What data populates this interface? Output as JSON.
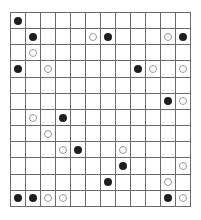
{
  "puzzle": {
    "rows": 12,
    "cols": 12,
    "colors": {
      "grid_line": "#6a6a6a",
      "black_stone": "#1e1e1e",
      "white_stone_border": "#9a9a9a",
      "background": "#ffffff"
    },
    "stones": [
      {
        "row": 0,
        "col": 0,
        "color": "black"
      },
      {
        "row": 1,
        "col": 1,
        "color": "black"
      },
      {
        "row": 1,
        "col": 5,
        "color": "white"
      },
      {
        "row": 1,
        "col": 6,
        "color": "black"
      },
      {
        "row": 1,
        "col": 10,
        "color": "white"
      },
      {
        "row": 1,
        "col": 11,
        "color": "black"
      },
      {
        "row": 2,
        "col": 1,
        "color": "white"
      },
      {
        "row": 3,
        "col": 0,
        "color": "black"
      },
      {
        "row": 3,
        "col": 2,
        "color": "white"
      },
      {
        "row": 3,
        "col": 8,
        "color": "black"
      },
      {
        "row": 3,
        "col": 9,
        "color": "white"
      },
      {
        "row": 3,
        "col": 11,
        "color": "white"
      },
      {
        "row": 5,
        "col": 10,
        "color": "black"
      },
      {
        "row": 5,
        "col": 11,
        "color": "white"
      },
      {
        "row": 6,
        "col": 1,
        "color": "white"
      },
      {
        "row": 6,
        "col": 3,
        "color": "black"
      },
      {
        "row": 7,
        "col": 2,
        "color": "white"
      },
      {
        "row": 8,
        "col": 3,
        "color": "white"
      },
      {
        "row": 8,
        "col": 4,
        "color": "black"
      },
      {
        "row": 8,
        "col": 7,
        "color": "white"
      },
      {
        "row": 9,
        "col": 7,
        "color": "black"
      },
      {
        "row": 9,
        "col": 11,
        "color": "white"
      },
      {
        "row": 10,
        "col": 6,
        "color": "black"
      },
      {
        "row": 10,
        "col": 10,
        "color": "white"
      },
      {
        "row": 11,
        "col": 0,
        "color": "black"
      },
      {
        "row": 11,
        "col": 1,
        "color": "black"
      },
      {
        "row": 11,
        "col": 2,
        "color": "white"
      },
      {
        "row": 11,
        "col": 3,
        "color": "white"
      },
      {
        "row": 11,
        "col": 10,
        "color": "black"
      },
      {
        "row": 11,
        "col": 11,
        "color": "white"
      }
    ]
  }
}
